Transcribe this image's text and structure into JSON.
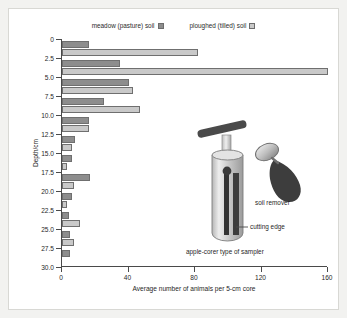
{
  "chart_data": {
    "type": "bar",
    "orientation": "horizontal",
    "title": "",
    "xlabel": "Average number of animals per 5-cm core",
    "ylabel": "Depth/cm",
    "xlim": [
      0,
      160
    ],
    "xticks": [
      0,
      40,
      80,
      120,
      160
    ],
    "yticks": [
      "0",
      "2.5",
      "5.0",
      "7.5",
      "10.0",
      "12.5",
      "15.0",
      "17.5",
      "20.0",
      "22.5",
      "25.0",
      "27.5",
      "30.0"
    ],
    "grid": false,
    "legend_position": "top",
    "categories": [
      "0-2.5",
      "2.5-5.0",
      "5.0-7.5",
      "7.5-10.0",
      "10.0-12.5",
      "12.5-15.0",
      "15.0-17.5",
      "17.5-20.0",
      "20.0-22.5",
      "22.5-25.0",
      "25.0-27.5",
      "27.5-30.0"
    ],
    "series": [
      {
        "name": "meadow (pasture) soil",
        "color": "#8d8d8d",
        "values": [
          16,
          35,
          40,
          25,
          16,
          8,
          6,
          17,
          6,
          4,
          5,
          5
        ]
      },
      {
        "name": "ploughed (tilled) soil",
        "color": "#c9c9c9",
        "values": [
          82,
          160,
          43,
          47,
          16,
          6,
          3,
          7,
          3,
          11,
          7,
          0
        ]
      }
    ]
  },
  "legend": {
    "entries": [
      {
        "label": "meadow (pasture) soil",
        "swatch": "meadow"
      },
      {
        "label": "ploughed (tilled) soil",
        "swatch": "plough"
      }
    ]
  },
  "illustration": {
    "sampler_label": "apple-corer type of sampler",
    "cutting_edge_label": "cutting edge",
    "soil_remover_label": "soil remover"
  },
  "colors": {
    "meadow": "#8d8d8d",
    "ploughed": "#c9c9c9",
    "axis": "#4a4a4a",
    "page_background": "#f2f2f0",
    "figure_background": "#ffffff"
  }
}
